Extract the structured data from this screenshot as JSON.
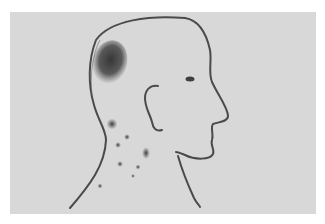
{
  "figure": {
    "description": "Line drawing of a bald head in right-facing profile with a dark shaded patch on the back of the scalp and scattered dark spots on the neck",
    "colors": {
      "page": "#ffffff",
      "panel": "#d9d9d9",
      "line": "#4a4a4a",
      "lesion": "#3a3a3a"
    }
  }
}
